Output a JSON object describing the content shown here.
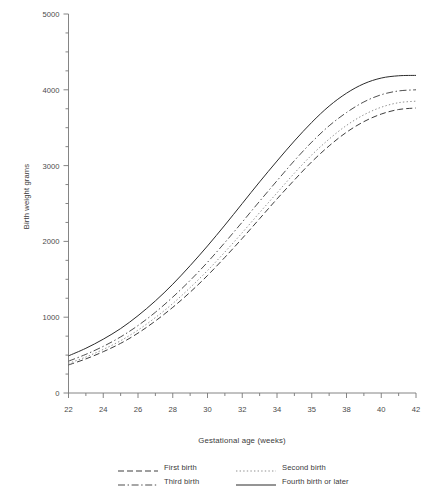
{
  "chart_data": {
    "type": "line",
    "title": "",
    "xlabel": "Gestational age (weeks)",
    "ylabel": "Birth weight grams",
    "xlim": [
      22,
      42
    ],
    "ylim": [
      0,
      5000
    ],
    "grid": false,
    "legend_position": "bottom",
    "x_ticks": [
      22,
      24,
      26,
      28,
      30,
      32,
      34,
      36,
      38,
      40,
      42
    ],
    "x_tick_labels": [
      "22",
      "24",
      "26",
      "28",
      "30",
      "32",
      "34",
      "35",
      "38",
      "40",
      "42"
    ],
    "y_ticks": [
      0,
      1000,
      2000,
      3000,
      4000,
      5000
    ],
    "y_tick_labels": [
      "0",
      "1000",
      "2000",
      "3000",
      "4000",
      "5000"
    ],
    "y_minor_tick_interval": 250,
    "x": [
      22,
      23,
      24,
      25,
      26,
      27,
      28,
      29,
      30,
      31,
      32,
      33,
      34,
      35,
      36,
      37,
      38,
      39,
      40,
      41,
      42
    ],
    "series": [
      {
        "name": "First birth",
        "style": "dashed",
        "color": "#333333",
        "values": [
          370,
          450,
          545,
          655,
          790,
          950,
          1130,
          1330,
          1550,
          1790,
          2040,
          2300,
          2560,
          2810,
          3050,
          3260,
          3440,
          3580,
          3680,
          3740,
          3760
        ]
      },
      {
        "name": "Second birth",
        "style": "dotted",
        "color": "#8a8a8a",
        "values": [
          390,
          475,
          575,
          690,
          830,
          995,
          1180,
          1390,
          1615,
          1860,
          2115,
          2380,
          2640,
          2900,
          3140,
          3350,
          3530,
          3670,
          3770,
          3830,
          3850
        ]
      },
      {
        "name": "Third birth",
        "style": "dashdot",
        "color": "#444444",
        "values": [
          420,
          510,
          615,
          740,
          890,
          1065,
          1265,
          1485,
          1725,
          1985,
          2255,
          2530,
          2800,
          3065,
          3310,
          3525,
          3700,
          3840,
          3935,
          3985,
          4000
        ]
      },
      {
        "name": "Fourth birth or later",
        "style": "solid",
        "color": "#2b2b2b",
        "values": [
          490,
          590,
          710,
          850,
          1020,
          1215,
          1435,
          1680,
          1940,
          2215,
          2500,
          2785,
          3060,
          3325,
          3570,
          3785,
          3955,
          4080,
          4155,
          4185,
          4190
        ]
      }
    ]
  },
  "legend": {
    "entries": [
      {
        "label": "First birth"
      },
      {
        "label": "Second birth"
      },
      {
        "label": "Third birth"
      },
      {
        "label": "Fourth birth or later"
      }
    ]
  }
}
